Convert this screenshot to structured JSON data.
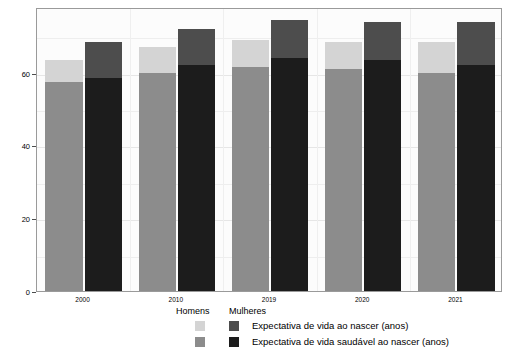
{
  "chart_data": {
    "type": "bar",
    "subtype": "grouped-stacked",
    "title": "",
    "xlabel": "",
    "ylabel": "Expectativa de vida ao nascer (anos)",
    "categories": [
      "2000",
      "2010",
      "2019",
      "2020",
      "2021"
    ],
    "ylim": [
      0,
      78
    ],
    "yticks": [
      0,
      20,
      40,
      60
    ],
    "ytick_labels": [
      "0",
      "20",
      "40",
      "60"
    ],
    "grid": true,
    "legend_position": "bottom",
    "legend": {
      "group_headers": [
        "Homens",
        "Mulheres"
      ],
      "rows": [
        {
          "label": "Expectativa de vida ao nascer (anos)",
          "homens_color": "#d4d4d4",
          "mulheres_color": "#4d4d4d"
        },
        {
          "label": "Expectativa de vida saudável ao nascer (anos)",
          "homens_color": "#8c8c8c",
          "mulheres_color": "#1c1c1c"
        }
      ]
    },
    "series": [
      {
        "name": "Homens - Expectativa de vida ao nascer (anos)",
        "group": "Homens",
        "measure": "Expectativa de vida ao nascer (anos)",
        "color": "#d4d4d4",
        "values": [
          63.5,
          67.0,
          69.0,
          68.5,
          68.5
        ]
      },
      {
        "name": "Homens - Expectativa de vida saudável ao nascer (anos)",
        "group": "Homens",
        "measure": "Expectativa de vida saudável ao nascer (anos)",
        "color": "#8c8c8c",
        "values": [
          57.5,
          60.0,
          61.5,
          61.0,
          60.0
        ]
      },
      {
        "name": "Mulheres - Expectativa de vida ao nascer (anos)",
        "group": "Mulheres",
        "measure": "Expectativa de vida ao nascer (anos)",
        "color": "#4d4d4d",
        "values": [
          68.5,
          72.0,
          74.5,
          74.0,
          74.0
        ]
      },
      {
        "name": "Mulheres - Expectativa de vida saudável ao nascer (anos)",
        "group": "Mulheres",
        "measure": "Expectativa de vida saudável ao nascer (anos)",
        "color": "#1c1c1c",
        "values": [
          58.5,
          62.0,
          64.0,
          63.5,
          62.0
        ]
      }
    ]
  }
}
